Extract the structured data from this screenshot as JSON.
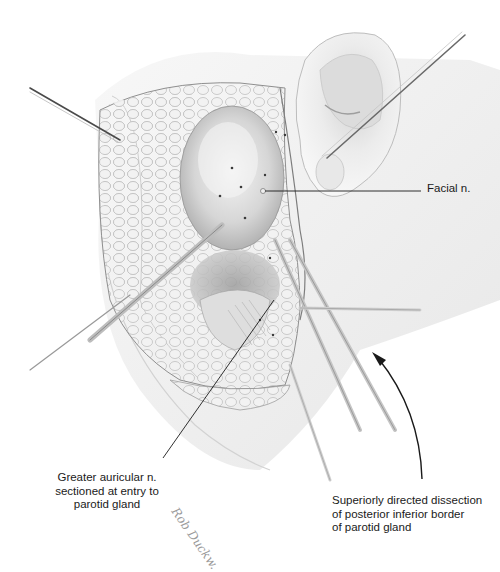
{
  "figure": {
    "type": "surgical illustration",
    "colors": {
      "background": "#ffffff",
      "skin": "#efefef",
      "gland": "#d9d9d9",
      "shadow": "#a8a8a8",
      "ink": "#1a1a1a",
      "instrument": "#bdbdbd"
    }
  },
  "labels": {
    "facial_nerve": {
      "lines": [
        "Facial n."
      ]
    },
    "greater_auricular": {
      "lines": [
        "Greater auricular n.",
        "sectioned at entry to",
        "parotid gland"
      ]
    },
    "dissection": {
      "lines": [
        "Superiorly directed dissection",
        "of posterior inferior border",
        "of parotid gland"
      ]
    }
  },
  "artist_signature": "Rob Duckw.",
  "leader_lines": [
    {
      "label": "facial_nerve",
      "from": [
        265,
        191
      ],
      "to": [
        421,
        191
      ]
    },
    {
      "label": "greater_auricular",
      "from": [
        274,
        300
      ],
      "to": [
        163,
        458
      ]
    }
  ],
  "arrow": {
    "label": "dissection",
    "direction": "up-left",
    "from": [
      422,
      479
    ],
    "to": [
      372,
      354
    ]
  }
}
